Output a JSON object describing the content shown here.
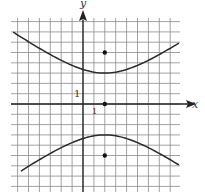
{
  "chart_data": {
    "type": "line",
    "title": "",
    "xlabel": "x",
    "ylabel": "y",
    "tick_labels": {
      "x": "1",
      "y": "1"
    },
    "grid": true,
    "xlim": [
      -6.5,
      8.5
    ],
    "ylim": [
      -8.1,
      8.2
    ],
    "equation": "y^2/9 - (x-2)^2/16 = 1",
    "center": [
      2,
      0
    ],
    "vertices": [
      [
        2,
        3
      ],
      [
        2,
        -3
      ]
    ],
    "foci": [
      [
        2,
        5
      ],
      [
        2,
        -5
      ]
    ],
    "points": [
      {
        "label": "upper focus",
        "x": 2,
        "y": 5
      },
      {
        "label": "center",
        "x": 2,
        "y": 0
      },
      {
        "label": "lower focus",
        "x": 2,
        "y": -5
      }
    ],
    "series": [
      {
        "name": "upper branch",
        "x": [
          -6.4,
          -4,
          -2,
          0,
          2,
          4,
          6,
          8.8
        ],
        "y": [
          6.6,
          5.4,
          4.2,
          3.35,
          3.0,
          3.35,
          4.24,
          5.75
        ]
      },
      {
        "name": "lower branch",
        "x": [
          -5.7,
          -4,
          -2,
          0,
          2,
          4,
          6,
          8.8
        ],
        "y": [
          -6.3,
          -5.4,
          -4.2,
          -3.35,
          -3.0,
          -3.35,
          -4.24,
          -5.75
        ]
      }
    ]
  }
}
